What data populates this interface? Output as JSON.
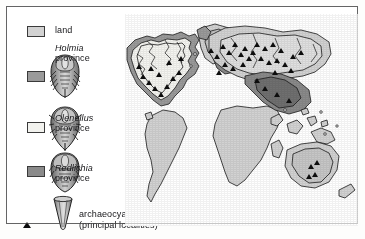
{
  "figure": {
    "border_color": "#5a5a5a",
    "background": "#ffffff"
  },
  "legend": {
    "items": [
      {
        "key": "land",
        "label": "land",
        "species": "",
        "province_word": "",
        "swatch_color": "#d2d2d2",
        "swatch_border": "#3a3a3a",
        "icon": "",
        "marker": ""
      },
      {
        "key": "holmia",
        "label": "",
        "species": "Holmia",
        "province_word": "province",
        "swatch_color": "#9a9a9a",
        "swatch_border": "#3a3a3a",
        "icon": "trilobite-holmia-icon",
        "marker": ""
      },
      {
        "key": "olenellus",
        "label": "",
        "species": "Olenellus",
        "province_word": "province",
        "swatch_color": "#f2f2ee",
        "swatch_border": "#3a3a3a",
        "icon": "trilobite-olenellus-icon",
        "marker": ""
      },
      {
        "key": "redlichia",
        "label": "",
        "species": "Redlichia",
        "province_word": "province",
        "swatch_color": "#8a8a8a",
        "swatch_border": "#3a3a3a",
        "icon": "trilobite-redlichia-icon",
        "marker": ""
      },
      {
        "key": "archaeocyathids",
        "label": "archaeocyathids",
        "sublabel": "(principal localities)",
        "species": "",
        "province_word": "",
        "swatch_color": "",
        "swatch_border": "",
        "icon": "archaeocyathid-cup-icon",
        "marker": "black-triangle"
      }
    ]
  },
  "map": {
    "name": "world-palaeogeographic-map",
    "colors": {
      "land": "#d2d2d2",
      "holmia_province": "#9a9a9a",
      "olenellus_province": "#f4f4f0",
      "redlichia_province": "#8a8a8a",
      "coastline": "#1a1a1a",
      "locality_marker": "#0d0d0d",
      "ocean": "#ffffff"
    },
    "marker_count_visible": 46,
    "regions": [
      "North America",
      "Greenland",
      "South America",
      "Africa",
      "Europe",
      "Siberia",
      "Asia",
      "Australia"
    ]
  }
}
